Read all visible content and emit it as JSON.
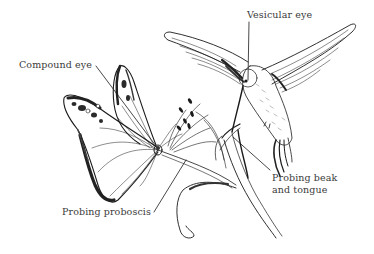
{
  "diagram": {
    "subjects": [
      "butterfly",
      "hummingbird",
      "flower"
    ],
    "labels": {
      "compound_eye": "Compound eye",
      "vesicular_eye": "Vesicular eye",
      "probing_beak_line1": "Probing beak",
      "probing_beak_line2": "and tongue",
      "probing_proboscis": "Probing proboscis"
    },
    "colors": {
      "ink": "#1a1a1a",
      "label_text": "#3a3a3a",
      "background": "#ffffff"
    }
  }
}
